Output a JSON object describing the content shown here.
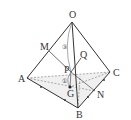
{
  "diagram": {
    "type": "tetrahedron",
    "points": {
      "O": {
        "label": "O",
        "x": 72,
        "y": 22
      },
      "A": {
        "label": "A",
        "x": 27,
        "y": 78
      },
      "B": {
        "label": "B",
        "x": 78,
        "y": 108
      },
      "C": {
        "label": "C",
        "x": 110,
        "y": 72
      },
      "M": {
        "label": "M",
        "x": 49,
        "y": 51
      },
      "N": {
        "label": "N",
        "x": 95,
        "y": 91
      },
      "P": {
        "label": "P",
        "x": 71,
        "y": 72
      },
      "Q": {
        "label": "Q",
        "x": 81,
        "y": 58
      },
      "G": {
        "label": "G",
        "x": 70,
        "y": 87
      }
    },
    "markers": {
      "circle_3": "③",
      "circle_1": "①"
    },
    "colors": {
      "line": "#333333",
      "dashed": "#666666",
      "fill": "#eeeeee"
    }
  }
}
